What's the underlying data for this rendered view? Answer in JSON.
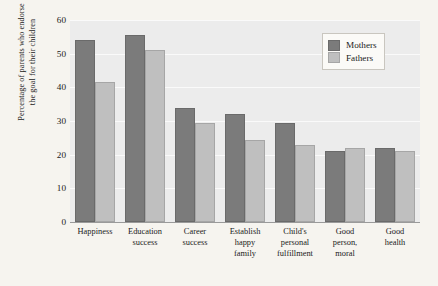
{
  "chart_data": {
    "type": "bar",
    "title": "",
    "xlabel": "",
    "ylabel_lines": [
      "Percentage of parents who endorse",
      "the goal for their children"
    ],
    "ylabel": "Percentage of parents who endorse the goal for their children",
    "ylim": [
      0,
      60
    ],
    "yticks": [
      0,
      10,
      20,
      30,
      40,
      50,
      60
    ],
    "ytick_labels": [
      "0",
      "10",
      "20",
      "30",
      "40",
      "50",
      "60"
    ],
    "grid": "horizontal",
    "legend_position": "top-right",
    "categories": [
      "Happiness",
      "Education success",
      "Career success",
      "Establish happy family",
      "Child's personal fulfillment",
      "Good person, moral",
      "Good health"
    ],
    "category_lines": [
      [
        "Happiness"
      ],
      [
        "Education",
        "success"
      ],
      [
        "Career",
        "success"
      ],
      [
        "Establish",
        "happy",
        "family"
      ],
      [
        "Child's",
        "personal",
        "fulfillment"
      ],
      [
        "Good",
        "person,",
        "moral"
      ],
      [
        "Good",
        "health"
      ]
    ],
    "series": [
      {
        "name": "Mothers",
        "color": "#7b7b7b",
        "values": [
          54,
          55.5,
          34,
          32,
          29.5,
          21,
          22
        ]
      },
      {
        "name": "Fathers",
        "color": "#bfbfbf",
        "values": [
          41.5,
          51,
          29.5,
          24.5,
          23,
          22,
          21
        ]
      }
    ]
  },
  "legend": {
    "items": [
      {
        "label": "Mothers",
        "swatch": "mothers"
      },
      {
        "label": "Fathers",
        "swatch": "fathers"
      }
    ]
  },
  "colors": {
    "page_background": "#f6f4ef",
    "plot_background": "#ececec",
    "gridline": "#fafafa",
    "axis": "#9a9a9a",
    "mothers": "#7b7b7b",
    "fathers": "#bfbfbf",
    "text": "#1a1a1a"
  }
}
